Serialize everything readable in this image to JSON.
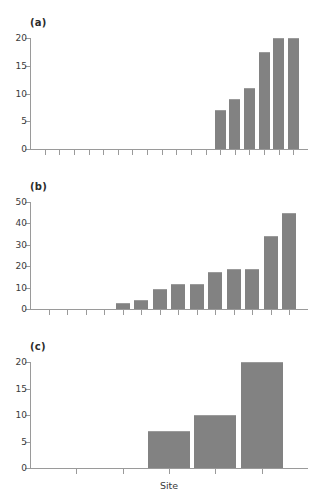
{
  "figure": {
    "background": "#ffffff",
    "bar_color": "#828282",
    "axis_color": "#9a9a9a",
    "text_color": "#3b3b3b"
  },
  "panels": [
    {
      "id": "a",
      "label": "(a)"
    },
    {
      "id": "b",
      "label": "(b)"
    },
    {
      "id": "c",
      "label": "(c)"
    }
  ],
  "xlabel": "Site",
  "chart_data": [
    {
      "type": "bar",
      "title": "(a)",
      "xlabel": "",
      "ylabel": "",
      "ylim": [
        0,
        20
      ],
      "yticks": [
        0,
        5,
        10,
        15,
        20
      ],
      "ytick_labels": [
        "0",
        "5",
        "10",
        "15",
        "20"
      ],
      "grid": false,
      "legend": "none",
      "n_x_positions": 18,
      "categories": [
        1,
        2,
        3,
        4,
        5,
        6,
        7,
        8,
        9,
        10,
        11,
        12,
        13,
        14,
        15,
        16,
        17,
        18
      ],
      "values": [
        0,
        0,
        0,
        0,
        0,
        0,
        0,
        0,
        0,
        0,
        0,
        0,
        7,
        9,
        11,
        17.5,
        20,
        20
      ]
    },
    {
      "type": "bar",
      "title": "(b)",
      "xlabel": "",
      "ylabel": "",
      "ylim": [
        0,
        50
      ],
      "yticks": [
        0,
        10,
        20,
        30,
        40,
        50
      ],
      "ytick_labels": [
        "0",
        "10",
        "20",
        "30",
        "40",
        "50"
      ],
      "grid": false,
      "legend": "none",
      "n_x_positions": 14,
      "categories": [
        1,
        2,
        3,
        4,
        5,
        6,
        7,
        8,
        9,
        10,
        11,
        12,
        13,
        14
      ],
      "values": [
        0,
        0,
        0,
        0,
        3,
        4,
        9.5,
        11.5,
        11.5,
        17.5,
        18.5,
        18.5,
        34,
        45
      ]
    },
    {
      "type": "bar",
      "title": "(c)",
      "xlabel": "Site",
      "ylabel": "",
      "ylim": [
        0,
        20
      ],
      "yticks": [
        0,
        5,
        10,
        15,
        20
      ],
      "ytick_labels": [
        "0",
        "5",
        "10",
        "15",
        "20"
      ],
      "grid": false,
      "legend": "none",
      "n_x_positions": 5,
      "categories": [
        1,
        2,
        3,
        4,
        5
      ],
      "values": [
        0,
        0,
        7,
        10,
        20
      ]
    }
  ]
}
